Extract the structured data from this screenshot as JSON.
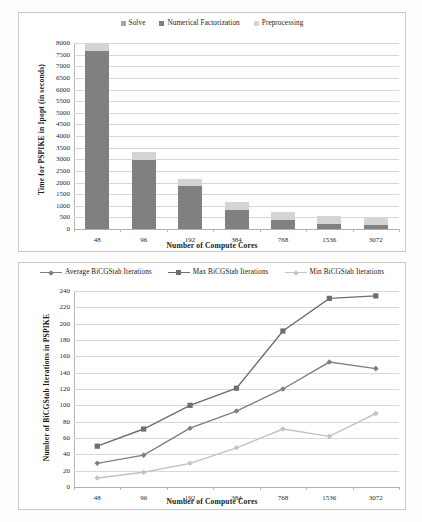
{
  "figure": {
    "background": "#fdfdfd",
    "panel_border": "#c9c9c9"
  },
  "chart_data": [
    {
      "id": "top",
      "type": "bar",
      "stacked": true,
      "title": "",
      "xlabel": "Number of Compute Cores",
      "ylabel": "Time for PSPIKE in Ipopt  (in seconds)",
      "categories": [
        "48",
        "96",
        "192",
        "384",
        "768",
        "1536",
        "3072"
      ],
      "ylim": [
        0,
        8000
      ],
      "ytick_step": 500,
      "yticks": [
        "0",
        "500",
        "1000",
        "1500",
        "2000",
        "2500",
        "3000",
        "3500",
        "4000",
        "4500",
        "5000",
        "5500",
        "6000",
        "6500",
        "7000",
        "7500",
        "8000"
      ],
      "grid": true,
      "legend_position": "top-center",
      "series": [
        {
          "name": "Solve",
          "color": "#a6a6a6",
          "values": [
            0,
            0,
            0,
            0,
            0,
            0,
            0
          ]
        },
        {
          "name": "Numerical Factorization",
          "color": "#808080",
          "values": [
            7670,
            2950,
            1870,
            830,
            400,
            230,
            180
          ]
        },
        {
          "name": "Preprocessing",
          "color": "#d4d4d4",
          "values": [
            330,
            350,
            300,
            340,
            345,
            345,
            310
          ]
        }
      ]
    },
    {
      "id": "bottom",
      "type": "line",
      "title": "",
      "xlabel": "Number of Compute Cores",
      "ylabel": "Number of BiCGStab Iterations in PSPIKE",
      "categories": [
        "48",
        "96",
        "192",
        "384",
        "768",
        "1536",
        "3072"
      ],
      "ylim": [
        0,
        240
      ],
      "ytick_step": 20,
      "yticks": [
        "0",
        "20",
        "40",
        "60",
        "80",
        "100",
        "120",
        "140",
        "160",
        "180",
        "200",
        "220",
        "240"
      ],
      "grid": true,
      "legend_position": "top-center",
      "series": [
        {
          "name": "Average BiCGStab Iterations",
          "color": "#7f7f7f",
          "marker": "diamond",
          "values": [
            29,
            39,
            72,
            93,
            120,
            153,
            145
          ]
        },
        {
          "name": "Max BiCGStab Iterations",
          "color": "#6e6e6e",
          "marker": "square",
          "values": [
            50,
            71,
            100,
            121,
            191,
            231,
            234
          ]
        },
        {
          "name": "Min BiCGStab Iterations",
          "color": "#c2c2c2",
          "marker": "diamond",
          "values": [
            11,
            18,
            29,
            48,
            71,
            62,
            90
          ]
        }
      ]
    }
  ]
}
